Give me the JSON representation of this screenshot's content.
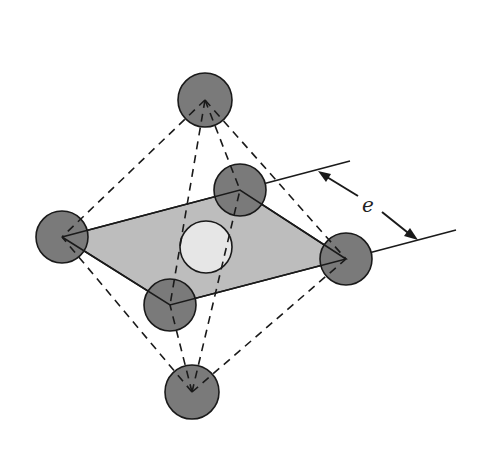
{
  "diagram": {
    "dimension_label": "e",
    "colors": {
      "atom_fill": "#7a7a7a",
      "interstitial_fill": "#e6e6e6",
      "plane_fill": "#bdbdbd",
      "stroke": "#1a1a1a"
    },
    "atoms": [
      {
        "id": "top",
        "cx": 205,
        "cy": 100,
        "r": 27
      },
      {
        "id": "back-right",
        "cx": 240,
        "cy": 190,
        "r": 26
      },
      {
        "id": "left",
        "cx": 62,
        "cy": 237,
        "r": 26
      },
      {
        "id": "right",
        "cx": 346,
        "cy": 259,
        "r": 26
      },
      {
        "id": "front",
        "cx": 170,
        "cy": 305,
        "r": 26
      },
      {
        "id": "bottom",
        "cx": 192,
        "cy": 392,
        "r": 27
      }
    ],
    "interstitial": {
      "cx": 206,
      "cy": 247,
      "r": 26
    }
  }
}
